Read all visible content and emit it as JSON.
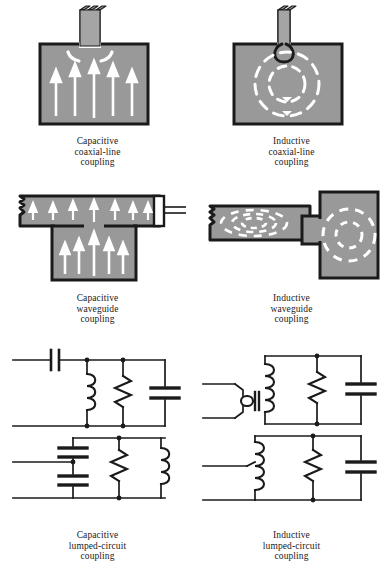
{
  "figure": {
    "background_color": "#ffffff",
    "metal_fill_color": "#999999",
    "outline_color": "#1a1a1a",
    "field_line_color": "#ffffff",
    "wire_color": "#1a1a1a"
  },
  "panels": [
    {
      "id": "capacitive-coaxial-line-coupling",
      "caption_lines": [
        "Capacitive",
        "coaxial-line",
        "coupling"
      ],
      "coupling_type": "Capacitive",
      "structure": "coaxial-line",
      "field": "electric",
      "field_arrow_count": 5,
      "arrow_direction": "up",
      "probe": "straight center conductor stub"
    },
    {
      "id": "inductive-coaxial-line-coupling",
      "caption_lines": [
        "Inductive",
        "coaxial-line",
        "coupling"
      ],
      "coupling_type": "Inductive",
      "structure": "coaxial-line",
      "field": "magnetic",
      "field_loop_count": 2,
      "arrow_direction": "clockwise",
      "probe": "small current loop"
    },
    {
      "id": "capacitive-waveguide-coupling",
      "caption_lines": [
        "Capacitive",
        "waveguide",
        "coupling"
      ],
      "coupling_type": "Capacitive",
      "structure": "waveguide",
      "field": "electric",
      "guide_arrow_count": 7,
      "cavity_arrow_count": 5,
      "arrow_direction": "up"
    },
    {
      "id": "inductive-waveguide-coupling",
      "caption_lines": [
        "Inductive",
        "waveguide",
        "coupling"
      ],
      "coupling_type": "Inductive",
      "structure": "waveguide",
      "field": "magnetic",
      "guide_loop_count": 3,
      "cavity_loop_count": 2,
      "arrow_direction": "clockwise"
    },
    {
      "id": "capacitive-lumped-circuit-coupling",
      "caption_lines": [
        "Capacitive",
        "lumped-circuit",
        "coupling"
      ],
      "coupling_type": "Capacitive",
      "structure": "lumped-circuit",
      "variants": [
        {
          "name": "series-capacitor-tank",
          "components": [
            "series capacitor",
            "shunt inductor",
            "shunt resistor",
            "shunt capacitor"
          ]
        },
        {
          "name": "capacitive-divider-tank",
          "components": [
            "series capacitor",
            "shunt capacitor tap",
            "shunt resistor",
            "shunt inductor"
          ]
        }
      ]
    },
    {
      "id": "inductive-lumped-circuit-coupling",
      "caption_lines": [
        "Inductive",
        "lumped-circuit",
        "coupling"
      ],
      "coupling_type": "Inductive",
      "structure": "lumped-circuit",
      "variants": [
        {
          "name": "transformer-coupled-tank",
          "components": [
            "transformer primary",
            "transformer secondary",
            "shunt resistor",
            "shunt capacitor"
          ]
        },
        {
          "name": "tapped-inductor-tank",
          "components": [
            "tapped inductor",
            "shunt resistor",
            "shunt capacitor"
          ]
        }
      ]
    }
  ]
}
